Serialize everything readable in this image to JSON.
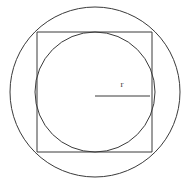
{
  "figure": {
    "canvas": {
      "width": 190,
      "height": 189,
      "background_color": "#ffffff"
    },
    "style": {
      "stroke_color": "#3a3a3a",
      "stroke_width": 1,
      "label_color": "#3a3a3a"
    },
    "shapes": {
      "outer_circle": {
        "name": "circumscribed-circle",
        "cx": 95,
        "cy": 92,
        "r": 85
      },
      "square": {
        "name": "square",
        "x": 37,
        "y": 32,
        "width": 115,
        "height": 120
      },
      "inner_circle": {
        "name": "inscribed-circle",
        "cx": 95,
        "cy": 92,
        "r": 60
      },
      "radius_line": {
        "name": "radius-segment",
        "x1": 95,
        "y1": 96,
        "x2": 150,
        "y2": 96
      }
    },
    "labels": {
      "radius": {
        "text": "r",
        "x": 122,
        "y": 87,
        "font_size": 9
      }
    }
  }
}
